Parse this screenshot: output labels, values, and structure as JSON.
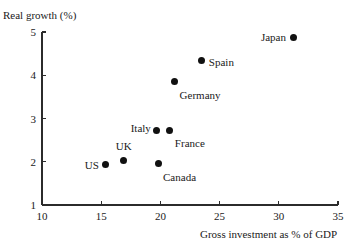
{
  "chart_data": {
    "type": "scatter",
    "title": "",
    "xlabel": "Gross investment as % of GDP",
    "ylabel": "Real growth (%)",
    "xlim": [
      10,
      35
    ],
    "ylim": [
      1,
      5
    ],
    "xticks": [
      10,
      15,
      20,
      25,
      30,
      35
    ],
    "yticks": [
      1,
      2,
      3,
      4,
      5
    ],
    "xtick_labels": [
      "10",
      "15",
      "20",
      "25",
      "30",
      "35"
    ],
    "ytick_labels": [
      "1",
      "2",
      "3",
      "4",
      "5"
    ],
    "grid": false,
    "legend": "none",
    "marker_color": "#111111",
    "axis_color": "#2b2b2b",
    "points": [
      {
        "label": "US",
        "x": 15.4,
        "y": 1.93,
        "label_pos": "left"
      },
      {
        "label": "UK",
        "x": 16.9,
        "y": 2.03,
        "label_pos": "above"
      },
      {
        "label": "Canada",
        "x": 19.8,
        "y": 1.95,
        "label_pos": "right-below"
      },
      {
        "label": "Italy",
        "x": 19.7,
        "y": 2.73,
        "label_pos": "left-above"
      },
      {
        "label": "France",
        "x": 20.8,
        "y": 2.73,
        "label_pos": "right-below"
      },
      {
        "label": "Germany",
        "x": 21.2,
        "y": 3.85,
        "label_pos": "right-below"
      },
      {
        "label": "Spain",
        "x": 23.5,
        "y": 4.35,
        "label_pos": "right"
      },
      {
        "label": "Japan",
        "x": 31.2,
        "y": 4.88,
        "label_pos": "left"
      }
    ]
  }
}
